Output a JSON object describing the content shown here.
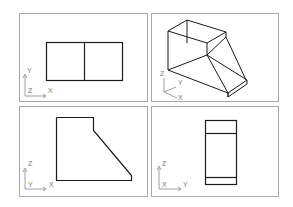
{
  "viewports": [
    {
      "name": "top-view",
      "ucs": {
        "vertical": "Y",
        "horizontal": "X",
        "corner": "Z"
      }
    },
    {
      "name": "isometric-view",
      "ucs": {
        "vertical": "Z",
        "diag1": "Y",
        "diag2": "X"
      }
    },
    {
      "name": "front-view",
      "ucs": {
        "vertical": "Z",
        "horizontal": "X",
        "corner": "Y"
      }
    },
    {
      "name": "side-view",
      "ucs": {
        "vertical": "Z",
        "horizontal": "Y",
        "corner": "X"
      }
    }
  ],
  "colors": {
    "frame": "#a8a8a8",
    "geometry": "#1a1a1a",
    "ucs": "#888888"
  }
}
